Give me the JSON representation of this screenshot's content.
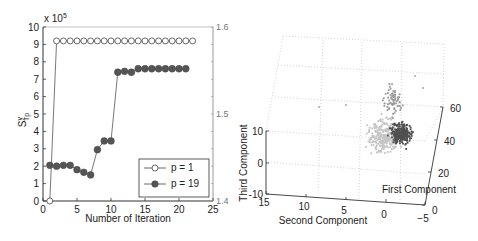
{
  "chart_data": [
    {
      "type": "line",
      "title": "",
      "xlabel": "Number of Iteration",
      "ylabel": "S^y_Tp",
      "ylabel_main": "S",
      "ylabel_sup": "y",
      "ylabel_sub": "Tp",
      "y_multiplier_label": "x 10",
      "y_multiplier_exp": "5",
      "xlim": [
        0,
        25
      ],
      "ylim": [
        0,
        10
      ],
      "xticks": [
        0,
        5,
        10,
        15,
        20,
        25
      ],
      "yticks": [
        0,
        1,
        2,
        3,
        4,
        5,
        6,
        7,
        8,
        9,
        10
      ],
      "y2lim": [
        1.4,
        1.6
      ],
      "y2ticks": [
        1.4,
        1.5,
        1.6
      ],
      "grid": false,
      "legend_position": "bottom-right",
      "series": [
        {
          "name": "p = 1",
          "marker": "open-circle",
          "x": [
            1,
            2,
            3,
            4,
            5,
            6,
            7,
            8,
            9,
            10,
            11,
            12,
            13,
            14,
            15,
            16,
            17,
            18,
            19,
            20,
            21,
            22
          ],
          "values": [
            0,
            9.2,
            9.2,
            9.2,
            9.2,
            9.2,
            9.2,
            9.2,
            9.2,
            9.2,
            9.2,
            9.2,
            9.2,
            9.2,
            9.2,
            9.2,
            9.2,
            9.2,
            9.2,
            9.2,
            9.2,
            9.2
          ]
        },
        {
          "name": "p = 19",
          "marker": "filled-circle",
          "x": [
            1,
            2,
            3,
            4,
            5,
            6,
            7,
            8,
            9,
            10,
            11,
            12,
            13,
            14,
            15,
            16,
            17,
            18,
            19,
            20,
            21
          ],
          "values": [
            2.05,
            2.0,
            2.05,
            2.05,
            1.8,
            1.65,
            1.5,
            2.95,
            3.45,
            3.45,
            7.4,
            7.45,
            7.4,
            7.6,
            7.6,
            7.6,
            7.6,
            7.6,
            7.6,
            7.6,
            7.6
          ]
        }
      ]
    },
    {
      "type": "scatter",
      "title": "",
      "xlabel": "First Component",
      "ylabel": "Second Component",
      "zlabel": "Third Component",
      "xlim": [
        0,
        60
      ],
      "ylim": [
        -5,
        15
      ],
      "zlim": [
        -10,
        10
      ],
      "xticks": [
        0,
        20,
        40,
        60
      ],
      "yticks": [
        15,
        10,
        5,
        0,
        -5
      ],
      "zticks": [
        -10,
        0,
        10
      ],
      "grid": true,
      "series": [
        {
          "name": "cluster-light",
          "color": "#c4c4c4",
          "description": "light gray point cloud spread across upper-left of the cluster"
        },
        {
          "name": "cluster-mid",
          "color": "#9a9a9a",
          "description": "medium gray points in upper tail"
        },
        {
          "name": "cluster-dark",
          "color": "#505050",
          "description": "dense dark gray core on right side of cluster"
        }
      ]
    }
  ]
}
